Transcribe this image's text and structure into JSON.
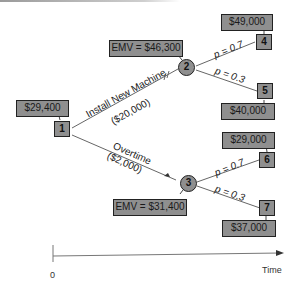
{
  "decision_tree": {
    "root": {
      "id": "1",
      "value": "$29,400"
    },
    "chance_nodes": [
      {
        "id": "2",
        "emv": "EMV = $46,300"
      },
      {
        "id": "3",
        "emv": "EMV = $31,400"
      }
    ],
    "branches": [
      {
        "label": "Install New Machine",
        "cost": "($20,000)"
      },
      {
        "label": "Overtime",
        "cost": "($2,000)"
      }
    ],
    "outcomes": [
      {
        "id": "4",
        "value": "$49,000",
        "prob": "p = 0.7"
      },
      {
        "id": "5",
        "value": "$40,000",
        "prob": "p = 0.3"
      },
      {
        "id": "6",
        "value": "$29,000",
        "prob": "p = 0.7"
      },
      {
        "id": "7",
        "value": "$37,000",
        "prob": "p = 0.3"
      }
    ]
  },
  "axis": {
    "origin": "0",
    "label": "Time"
  },
  "colors": {
    "node_fill": "#8f8f8f",
    "line": "#555555"
  }
}
